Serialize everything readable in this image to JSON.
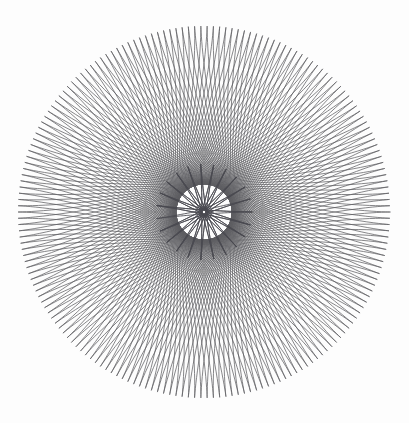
{
  "artwork": {
    "title": "Spirograph Pattern",
    "description": "Two concentric hypotrochoid spirograph figures drawn in dark grey line art on an off-white background.",
    "canvas": {
      "width": 409,
      "height": 423,
      "background_color": "#fdfdfd"
    },
    "center": {
      "x": 204,
      "y": 212
    }
  },
  "chart_data": {
    "type": "line",
    "subtitle": "",
    "xlabel": "",
    "ylabel": "",
    "grid": false,
    "legend_position": "none",
    "xlim": [
      0,
      409
    ],
    "ylim": [
      0,
      423
    ],
    "render": {
      "background_color": "#fdfdfd",
      "center_x": 204,
      "center_y": 212
    },
    "series": [
      {
        "name": "outer-ring-hypotrochoid",
        "curve_type": "hypotrochoid",
        "stroke_color": "#55555a",
        "stroke_width": 0.75,
        "opacity": 0.95,
        "R": 186,
        "r": 79,
        "d": 79,
        "lobes": 47,
        "turns": 79,
        "samples": 7600,
        "phase_deg": 0,
        "outer_radius": 186,
        "inner_radius": 107,
        "bbox": {
          "left": 18,
          "top": 26,
          "right": 390,
          "bottom": 398
        }
      },
      {
        "name": "inner-rosette-hypotrochoid",
        "curve_type": "hypotrochoid",
        "stroke_color": "#4a4a50",
        "stroke_width": 0.9,
        "opacity": 1.0,
        "R": 48,
        "r": 25.043,
        "d": 25.043,
        "lobes": 23,
        "turns": 23,
        "samples": 4200,
        "phase_deg": 0,
        "outer_radius": 48,
        "inner_radius": 2,
        "bbox": {
          "left": 156,
          "top": 164,
          "right": 252,
          "bottom": 260
        }
      }
    ],
    "annotations": [
      {
        "name": "center-hub",
        "x": 204,
        "y": 212,
        "note": "dense convergence point with tiny white pinhole"
      }
    ]
  }
}
